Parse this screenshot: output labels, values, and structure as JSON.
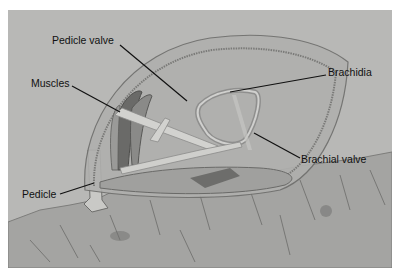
{
  "diagram": {
    "labels": [
      {
        "id": "pedicle-valve",
        "text": "Pedicle valve"
      },
      {
        "id": "brachidia",
        "text": "Brachidia"
      },
      {
        "id": "muscles",
        "text": "Muscles"
      },
      {
        "id": "brachial-valve",
        "text": "Brachial valve"
      },
      {
        "id": "pedicle",
        "text": "Pedicle"
      }
    ]
  },
  "colors": {
    "background": "#b8b8b6",
    "border": "#ffffff",
    "shell": "#a3a3a1",
    "rock": "#9e9e9c",
    "line": "#111111"
  }
}
